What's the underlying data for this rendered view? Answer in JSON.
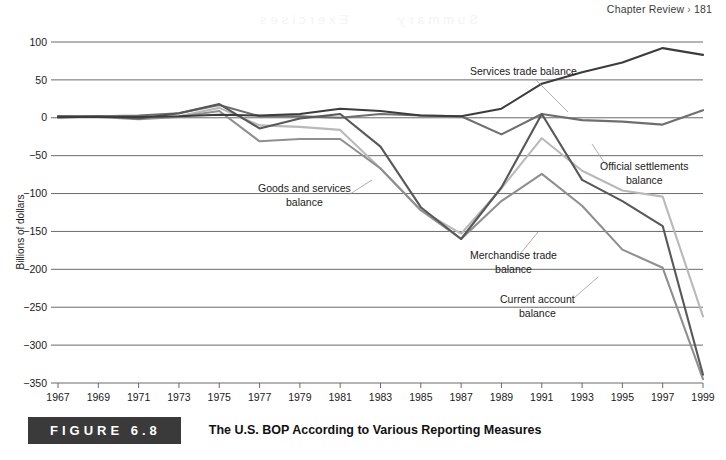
{
  "running_head": {
    "text": "Chapter Review",
    "chevron": "›",
    "page_number": "181"
  },
  "bleed_artifact": {
    "word_1": "Summary",
    "word_2": "Exercises"
  },
  "caption": {
    "badge": "FIGURE 6.8",
    "title": "The U.S. BOP According to Various Reporting Measures"
  },
  "colors": {
    "services": "#3c3c3c",
    "official": "#6e6e6e",
    "merchandise": "#8f8f8f",
    "goods_services": "#b9b9b9",
    "current_account": "#585858",
    "gridline": "#5a5a5a",
    "text": "#1a1a1a",
    "leader": "#9a9a9a",
    "badge_bg": "#3a3a3a"
  },
  "chart_data": {
    "type": "line",
    "title": "The U.S. BOP According to Various Reporting Measures",
    "xlabel": "",
    "ylabel": "Billions of dollars",
    "grid": true,
    "legend": "annotations",
    "xlim": [
      1967,
      1999
    ],
    "ylim": [
      -350,
      100
    ],
    "ytick_labels": [
      "100",
      "50",
      "0",
      "−50",
      "−100",
      "−150",
      "−200",
      "−250",
      "−300",
      "−350"
    ],
    "yticks": [
      100,
      50,
      0,
      -50,
      -100,
      -150,
      -200,
      -250,
      -300,
      -350
    ],
    "xtick_labels": [
      "1967",
      "1969",
      "1971",
      "1973",
      "1975",
      "1977",
      "1979",
      "1981",
      "1983",
      "1985",
      "1987",
      "1989",
      "1991",
      "1993",
      "1995",
      "1997",
      "1999"
    ],
    "x": [
      1967,
      1969,
      1971,
      1973,
      1975,
      1977,
      1979,
      1981,
      1983,
      1985,
      1987,
      1989,
      1991,
      1993,
      1995,
      1997,
      1999
    ],
    "series": [
      {
        "name": "Services trade balance",
        "color": "#3c3c3c",
        "values": [
          1,
          1,
          1,
          2,
          4,
          3,
          5,
          12,
          9,
          3,
          2,
          12,
          45,
          60,
          73,
          92,
          83
        ]
      },
      {
        "name": "Official settlements balance",
        "color": "#6e6e6e",
        "values": [
          0,
          2,
          3,
          6,
          17,
          2,
          2,
          0,
          5,
          3,
          2,
          -22,
          5,
          -3,
          -5,
          -9,
          10
        ]
      },
      {
        "name": "Merchandise trade balance",
        "color": "#8f8f8f",
        "values": [
          2,
          1,
          -2,
          1,
          9,
          -31,
          -28,
          -28,
          -67,
          -122,
          -160,
          -110,
          -74,
          -116,
          -174,
          -198,
          -345
        ]
      },
      {
        "name": "Goods and services balance",
        "color": "#b9b9b9",
        "values": [
          1,
          2,
          -1,
          2,
          13,
          -10,
          -12,
          -16,
          -67,
          -122,
          -153,
          -93,
          -27,
          -70,
          -96,
          -104,
          -262
        ]
      },
      {
        "name": "Current account balance",
        "color": "#585858",
        "values": [
          2,
          2,
          -1,
          6,
          18,
          -14,
          -1,
          5,
          -38,
          -118,
          -160,
          -92,
          5,
          -82,
          -110,
          -143,
          -339
        ]
      }
    ],
    "annotations": [
      {
        "label": "Services trade balance",
        "line_1": "Services trade balance",
        "line_2": "",
        "target_series": "Services trade balance"
      },
      {
        "label": "Official settlements balance",
        "line_1": "Official settlements",
        "line_2": "balance",
        "target_series": "Official settlements balance"
      },
      {
        "label": "Goods and services balance",
        "line_1": "Goods and services",
        "line_2": "balance",
        "target_series": "Goods and services balance"
      },
      {
        "label": "Merchandise trade balance",
        "line_1": "Merchandise trade",
        "line_2": "balance",
        "target_series": "Merchandise trade balance"
      },
      {
        "label": "Current account balance",
        "line_1": "Current account",
        "line_2": "balance",
        "target_series": "Current account balance"
      }
    ]
  }
}
